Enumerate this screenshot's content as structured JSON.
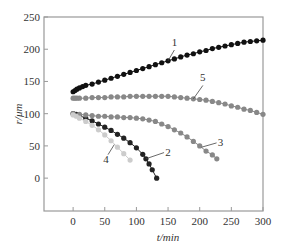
{
  "chart_data": {
    "type": "scatter",
    "title": "",
    "xlabel": "t/min",
    "ylabel": "r/μm",
    "xlim": [
      -46,
      300
    ],
    "ylim": [
      -51,
      250
    ],
    "xticks": [
      0,
      50,
      100,
      150,
      200,
      250,
      300
    ],
    "yticks": [
      0,
      50,
      100,
      150,
      200,
      250
    ],
    "grid": false,
    "legend": "inline numeric labels",
    "series": [
      {
        "name": "1",
        "color": "#111111",
        "x": [
          0,
          3,
          6,
          10,
          15,
          20,
          30,
          40,
          50,
          60,
          70,
          80,
          90,
          100,
          110,
          120,
          130,
          140,
          150,
          160,
          170,
          180,
          190,
          200,
          210,
          220,
          230,
          240,
          250,
          260,
          270,
          280,
          290,
          300
        ],
        "y": [
          134,
          136,
          138,
          140,
          142,
          144,
          146,
          149,
          152,
          155,
          158,
          161,
          164,
          167,
          170,
          173,
          176,
          179,
          182,
          185,
          188,
          191,
          193,
          196,
          198,
          201,
          203,
          205,
          207,
          209,
          211,
          212,
          213,
          214
        ]
      },
      {
        "name": "2",
        "color": "#222222",
        "x": [
          0,
          5,
          10,
          20,
          30,
          40,
          50,
          60,
          70,
          80,
          90,
          100,
          110,
          115,
          120,
          125,
          132
        ],
        "y": [
          100,
          99,
          97,
          93,
          89,
          84,
          79,
          74,
          68,
          62,
          55,
          47,
          37,
          30,
          22,
          13,
          0
        ]
      },
      {
        "name": "3",
        "color": "#888888",
        "x": [
          0,
          10,
          20,
          30,
          40,
          50,
          60,
          70,
          80,
          90,
          100,
          110,
          120,
          130,
          140,
          150,
          160,
          170,
          180,
          190,
          200,
          210,
          220,
          227
        ],
        "y": [
          100,
          99,
          98,
          97,
          96,
          96,
          95,
          95,
          94,
          94,
          93,
          92,
          90,
          88,
          84,
          80,
          75,
          70,
          64,
          57,
          50,
          42,
          36,
          30
        ]
      },
      {
        "name": "4",
        "color": "#cccccc",
        "x": [
          0,
          5,
          10,
          20,
          30,
          40,
          50,
          60,
          70,
          80,
          90
        ],
        "y": [
          98,
          96,
          93,
          88,
          82,
          75,
          67,
          58,
          48,
          38,
          28
        ]
      },
      {
        "name": "5",
        "color": "#888888",
        "x": [
          0,
          3,
          6,
          10,
          20,
          30,
          40,
          50,
          60,
          70,
          80,
          90,
          100,
          110,
          120,
          130,
          140,
          150,
          160,
          170,
          180,
          190,
          200,
          210,
          220,
          230,
          240,
          250,
          260,
          270,
          280,
          290,
          300
        ],
        "y": [
          124,
          124,
          124,
          124,
          124,
          125,
          125,
          125,
          126,
          126,
          126,
          127,
          127,
          127,
          127,
          127,
          127,
          127,
          126,
          125,
          124,
          123,
          122,
          121,
          119,
          117,
          115,
          112,
          110,
          107,
          105,
          102,
          99
        ]
      }
    ],
    "annotations": [
      {
        "text": "1",
        "x": 160,
        "y": 205
      },
      {
        "text": "5",
        "x": 205,
        "y": 150
      },
      {
        "text": "3",
        "x": 233,
        "y": 50
      },
      {
        "text": "2",
        "x": 150,
        "y": 35
      },
      {
        "text": "4",
        "x": 52,
        "y": 24
      }
    ]
  }
}
